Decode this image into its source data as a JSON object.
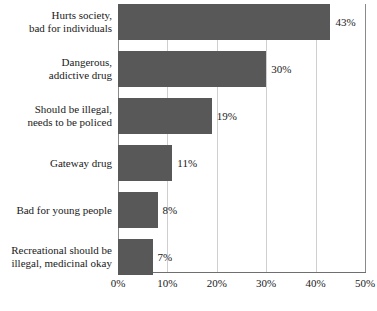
{
  "chart_data": {
    "type": "bar",
    "orientation": "horizontal",
    "title": "",
    "xlabel": "",
    "ylabel": "",
    "xlim": [
      0,
      50
    ],
    "grid": true,
    "legend": false,
    "categories": [
      "Hurts society, bad for individuals",
      "Dangerous, addictive drug",
      "Should be illegal, needs to be policed",
      "Gateway drug",
      "Bad for young people",
      "Recreational should be illegal, medicinal okay"
    ],
    "category_lines": [
      [
        "Hurts society,",
        "bad for individuals"
      ],
      [
        "Dangerous,",
        "addictive drug"
      ],
      [
        "Should be illegal,",
        "needs to be policed"
      ],
      [
        "Gateway drug"
      ],
      [
        "Bad for young people"
      ],
      [
        "Recreational should be",
        "illegal, medicinal okay"
      ]
    ],
    "values": [
      43,
      30,
      19,
      11,
      8,
      7
    ],
    "value_labels": [
      "43%",
      "30%",
      "19%",
      "11%",
      "8%",
      "7%"
    ],
    "xticks": [
      0,
      10,
      20,
      30,
      40,
      50
    ],
    "xtick_labels": [
      "0%",
      "10%",
      "20%",
      "30%",
      "40%",
      "50%"
    ],
    "colors": {
      "bar_fill": "#585858",
      "gridline": "#cfcfcf",
      "axis": "#6f6f6f",
      "text": "#1a1a1a",
      "background": "#ffffff"
    }
  }
}
